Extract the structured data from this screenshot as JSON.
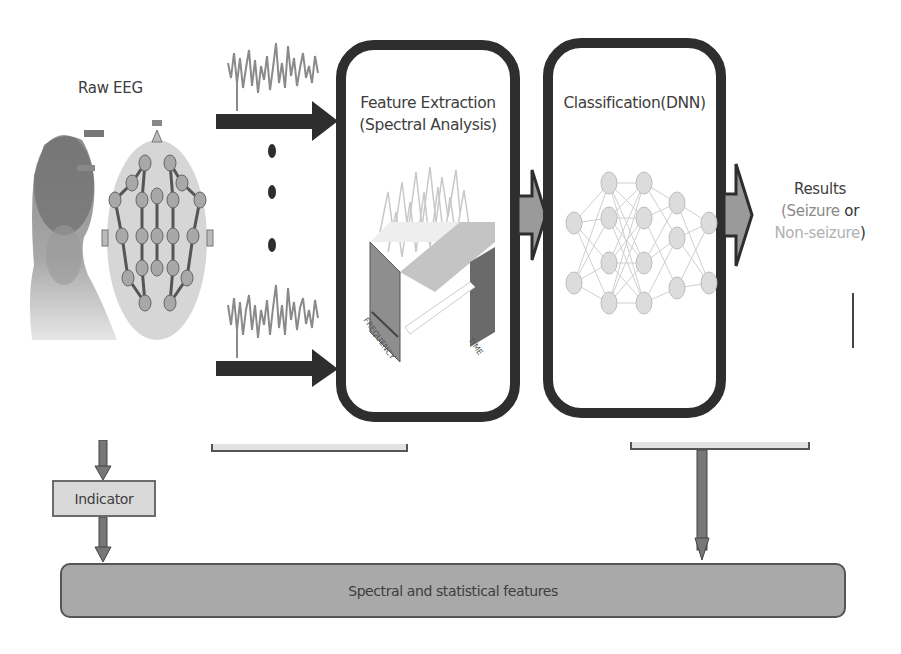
{
  "diagram": {
    "input": {
      "title": "Raw EEG",
      "head_icon": "head-with-eeg-cap-icon",
      "electrode_map_icon": "electrode-montage-icon",
      "signal_icon": "eeg-waveform-icon",
      "ellipsis_dots": 3
    },
    "stages": [
      {
        "title_line1": "Feature Extraction",
        "title_line2": "(Spectral Analysis)",
        "illustration": "time-frequency-spectrogram-icon",
        "axis_labels": [
          "FREQUENCY",
          "TIME"
        ]
      },
      {
        "title_line1": "Classification(DNN)",
        "illustration": "neural-network-icon"
      }
    ],
    "results": {
      "title": "Results",
      "open_paren": "(",
      "seizure": "Seizure",
      "or": " or",
      "non_seizure": "Non-seizure",
      "close_paren": ")"
    },
    "indicator_label": "Indicator",
    "features_bar_label": "Spectral and statistical features",
    "colors": {
      "box_border": "#2e2e2e",
      "arrow_dark": "#2e2e2e",
      "arrow_fill": "#9a9a9a",
      "features_bar": "#a9a9a9",
      "indicator_box": "#d9d9d9",
      "seizure_text": "#8a8a8a",
      "non_seizure_text": "#b0b0b0"
    }
  }
}
